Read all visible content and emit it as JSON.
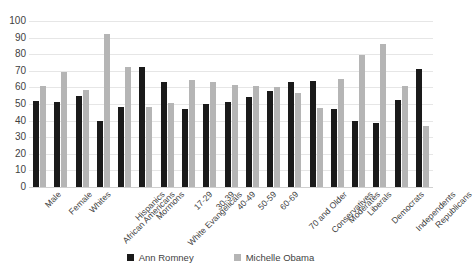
{
  "chart_data": {
    "type": "bar",
    "title": "",
    "subtitle": "",
    "xlabel": "",
    "ylabel": "",
    "ylim": [
      0,
      100
    ],
    "ytick_step": 10,
    "yticks": [
      100,
      90,
      80,
      70,
      60,
      50,
      40,
      30,
      20,
      10,
      0
    ],
    "grid": true,
    "legend_position": "bottom",
    "categories": [
      "Male",
      "Female",
      "Whites",
      "African Americans",
      "Hispanics",
      "Mormons",
      "White Evangelicals",
      "17-29",
      "30-39",
      "40-49",
      "50-59",
      "60-69",
      "70 and Older",
      "Conservatives",
      "Moderates",
      "Liberals",
      "Democrats",
      "Independents",
      "Republicans"
    ],
    "series": [
      {
        "name": "Ann Romney",
        "color": "#1a1a1a",
        "values": [
          52,
          51.5,
          55,
          40,
          48,
          72.5,
          63,
          47,
          50,
          51,
          54,
          58,
          63.5,
          64,
          47,
          39.5,
          38.5,
          52.5,
          71
        ]
      },
      {
        "name": "Michelle Obama",
        "color": "#b5b5b5",
        "values": [
          61,
          69.5,
          58.5,
          92,
          72,
          48.5,
          50.5,
          64.5,
          63,
          61.5,
          61,
          60,
          56.5,
          47.5,
          65,
          79.5,
          86,
          61,
          37
        ]
      }
    ]
  },
  "legend": {
    "items": [
      {
        "label": "Ann Romney"
      },
      {
        "label": "Michelle Obama"
      }
    ]
  }
}
